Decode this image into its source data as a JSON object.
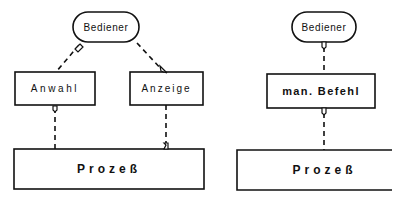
{
  "left_diagram": {
    "operator": {
      "label": "Bediener"
    },
    "selection": {
      "label": "Anwahl"
    },
    "display": {
      "label": "Anzeige"
    },
    "process": {
      "label": "Prozeß"
    }
  },
  "right_diagram": {
    "operator": {
      "label": "Bediener"
    },
    "manual_command": {
      "label": "man. Befehl"
    },
    "process": {
      "label": "Prozeß"
    }
  },
  "colors": {
    "line": "#111111",
    "background": "#ffffff"
  }
}
